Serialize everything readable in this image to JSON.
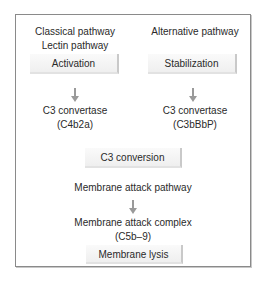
{
  "diagram": {
    "left_column": {
      "headings": [
        "Classical pathway",
        "Lectin pathway"
      ],
      "step_box": "Activation",
      "result": [
        "C3 convertase",
        "(C4b2a)"
      ]
    },
    "right_column": {
      "headings": [
        "Alternative pathway"
      ],
      "step_box": "Stabilization",
      "result": [
        "C3 convertase",
        "(C3bBbP)"
      ]
    },
    "center": {
      "conversion_box": "C3 conversion",
      "pathway_label": "Membrane attack pathway",
      "complex": [
        "Membrane attack complex",
        "(C5b–9)"
      ],
      "final_box": "Membrane lysis"
    },
    "colors": {
      "frame": "#8a8a8a",
      "arrow": "#9a9a9a",
      "box_bg": "#f4f4f4",
      "text": "#2a2a2a"
    }
  }
}
